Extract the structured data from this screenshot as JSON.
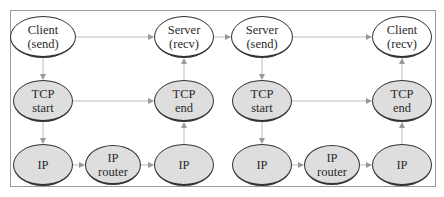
{
  "diagram": {
    "frame_color": "#9a9a9a",
    "edge_color": "#bdbdbd",
    "nodes": [
      {
        "id": "client-send",
        "line1": "Client",
        "line2": "(send)",
        "fill": "white",
        "cx": 43,
        "cy": 37,
        "w": 66,
        "h": 42
      },
      {
        "id": "server-recv",
        "line1": "Server",
        "line2": "(recv)",
        "fill": "white",
        "cx": 184,
        "cy": 37,
        "w": 60,
        "h": 42
      },
      {
        "id": "tcp-start-1",
        "line1": "TCP",
        "line2": "start",
        "fill": "gray",
        "cx": 43,
        "cy": 101,
        "w": 60,
        "h": 42
      },
      {
        "id": "tcp-end-1",
        "line1": "TCP",
        "line2": "end",
        "fill": "gray",
        "cx": 184,
        "cy": 101,
        "w": 60,
        "h": 42
      },
      {
        "id": "ip-1a",
        "line1": "IP",
        "line2": "",
        "fill": "gray",
        "cx": 43,
        "cy": 165,
        "w": 60,
        "h": 42
      },
      {
        "id": "ip-router-1",
        "line1": "IP",
        "line2": "router",
        "fill": "gray",
        "cx": 113,
        "cy": 165,
        "w": 56,
        "h": 40
      },
      {
        "id": "ip-1b",
        "line1": "IP",
        "line2": "",
        "fill": "gray",
        "cx": 184,
        "cy": 165,
        "w": 60,
        "h": 42
      },
      {
        "id": "server-send",
        "line1": "Server",
        "line2": "(send)",
        "fill": "white",
        "cx": 262,
        "cy": 37,
        "w": 62,
        "h": 42
      },
      {
        "id": "client-recv",
        "line1": "Client",
        "line2": "(recv)",
        "fill": "white",
        "cx": 402,
        "cy": 37,
        "w": 60,
        "h": 42
      },
      {
        "id": "tcp-start-2",
        "line1": "TCP",
        "line2": "start",
        "fill": "gray",
        "cx": 262,
        "cy": 101,
        "w": 60,
        "h": 42
      },
      {
        "id": "tcp-end-2",
        "line1": "TCP",
        "line2": "end",
        "fill": "gray",
        "cx": 402,
        "cy": 101,
        "w": 60,
        "h": 42
      },
      {
        "id": "ip-2a",
        "line1": "IP",
        "line2": "",
        "fill": "gray",
        "cx": 262,
        "cy": 165,
        "w": 60,
        "h": 42
      },
      {
        "id": "ip-router-2",
        "line1": "IP",
        "line2": "router",
        "fill": "gray",
        "cx": 332,
        "cy": 165,
        "w": 56,
        "h": 40
      },
      {
        "id": "ip-2b",
        "line1": "IP",
        "line2": "",
        "fill": "gray",
        "cx": 402,
        "cy": 165,
        "w": 60,
        "h": 42
      }
    ],
    "edges": [
      [
        "client-send",
        "server-recv"
      ],
      [
        "client-send",
        "tcp-start-1"
      ],
      [
        "tcp-start-1",
        "tcp-end-1"
      ],
      [
        "tcp-start-1",
        "ip-1a"
      ],
      [
        "ip-1a",
        "ip-router-1"
      ],
      [
        "ip-router-1",
        "ip-1b"
      ],
      [
        "ip-1b",
        "tcp-end-1"
      ],
      [
        "tcp-end-1",
        "server-recv"
      ],
      [
        "server-recv",
        "server-send"
      ],
      [
        "server-send",
        "client-recv"
      ],
      [
        "server-send",
        "tcp-start-2"
      ],
      [
        "tcp-start-2",
        "tcp-end-2"
      ],
      [
        "tcp-start-2",
        "ip-2a"
      ],
      [
        "ip-2a",
        "ip-router-2"
      ],
      [
        "ip-router-2",
        "ip-2b"
      ],
      [
        "ip-2b",
        "tcp-end-2"
      ],
      [
        "tcp-end-2",
        "client-recv"
      ]
    ]
  }
}
